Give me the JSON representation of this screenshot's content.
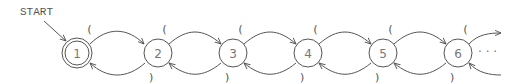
{
  "diagram": {
    "start_label": "START",
    "states": [
      {
        "id": "1",
        "label": "1",
        "accepting": true
      },
      {
        "id": "2",
        "label": "2",
        "accepting": false
      },
      {
        "id": "3",
        "label": "3",
        "accepting": false
      },
      {
        "id": "4",
        "label": "4",
        "accepting": false
      },
      {
        "id": "5",
        "label": "5",
        "accepting": false
      },
      {
        "id": "6",
        "label": "6",
        "accepting": false
      }
    ],
    "forward_label": "(",
    "backward_label": ")",
    "continuation": "· · ·",
    "colors": {
      "stroke": "#555555",
      "text": "#777777",
      "background": "#ffffff"
    }
  }
}
